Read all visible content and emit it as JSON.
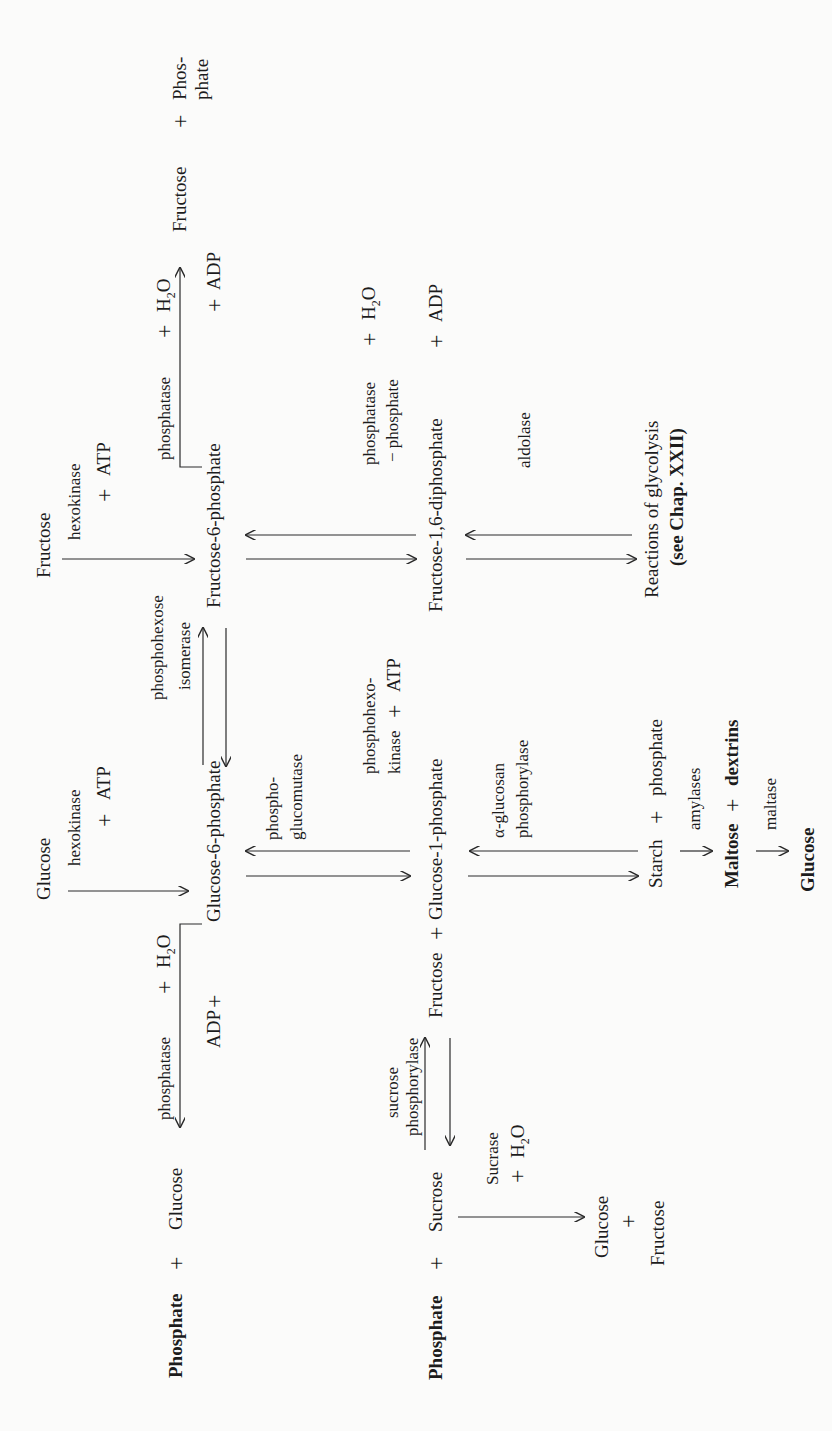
{
  "orientation": "rotated 90° counter-clockwise",
  "compounds": {
    "glucose_top": "Glucose",
    "fructose_top": "Fructose",
    "glucose_6_phosphate": "Glucose-6-phosphate",
    "fructose_6_phosphate": "Fructose-6-phosphate",
    "glucose_1_phosphate": "Glucose-1-phosphate",
    "fructose_1_6_diphosphate": "Fructose-1,6-diphosphate",
    "adp_left": "ADP",
    "adp_f6p": "ADP",
    "adp_fdp": "ADP",
    "phosphate_glucose": "Phosphate",
    "glucose_bottom": "Glucose",
    "phosphate_sucrose": "Phosphate",
    "sucrose": "Sucrose",
    "fructose_g1p": "Fructose",
    "glucose_prod": "Glucose",
    "fructose_prod": "Fructose",
    "fructose_right": "Fructose",
    "phos_right_1": "Phos-",
    "phos_right_2": "phate",
    "starch": "Starch",
    "starch_phosphate": "phosphate",
    "maltose": "Maltose",
    "dextrins": "dextrins",
    "glucose_final": "Glucose",
    "glycolysis_1": "Reactions of glycolysis",
    "glycolysis_2": "(see Chap. XXII)"
  },
  "enzymes": {
    "hexokinase_glucose": "hexokinase",
    "atp_glucose": "ATP",
    "hexokinase_fructose": "hexokinase",
    "atp_fructose": "ATP",
    "phosphohexose_1": "phosphohexose",
    "phosphohexose_2": "isomerase",
    "phosphatase_g6p": "phosphatase",
    "h2o_g6p": "H",
    "h2o_g6p_sub": "2",
    "h2o_g6p_o": "O",
    "phosphatase_f6p": "phosphatase",
    "h2o_f6p": "H",
    "h2o_f6p_sub": "2",
    "h2o_f6p_o": "O",
    "phosphatase_fdp": "phosphatase",
    "h2o_fdp": "H",
    "h2o_fdp_sub": "2",
    "h2o_fdp_o": "O",
    "minus_phosphate": "− phosphate",
    "phosphoglucomutase_1": "phospho-",
    "phosphoglucomutase_2": "glucomutase",
    "phosphohexokinase_1": "phosphohexo-",
    "phosphohexokinase_2": "kinase",
    "atp_phk": "ATP",
    "aldolase": "aldolase",
    "alpha_glucosan_1": "α-glucosan",
    "alpha_glucosan_2": "phosphorylase",
    "sucrose_phosphorylase_1": "sucrose",
    "sucrose_phosphorylase_2": "phosphorylase",
    "sucrase": "Sucrase",
    "h2o_sucrase": "H",
    "h2o_sucrase_sub": "2",
    "h2o_sucrase_o": "O",
    "amylases": "amylases",
    "maltase": "maltase"
  },
  "symbols": {
    "plus": "+"
  }
}
